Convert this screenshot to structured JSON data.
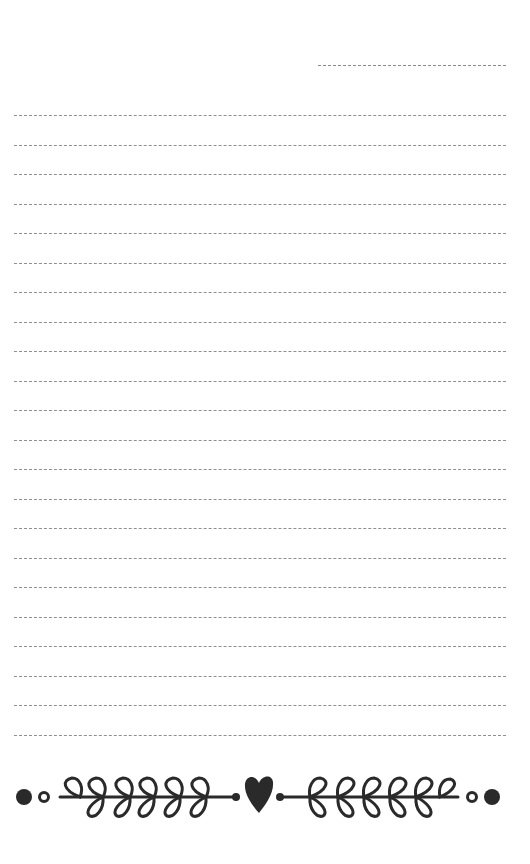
{
  "page": {
    "type": "lined notepad page",
    "background": "#ffffff",
    "line_color": "#8f8f8f",
    "ink_color": "#2a2a2a"
  },
  "date_line": {
    "label": ""
  },
  "lines": {
    "count": 22,
    "top": 0,
    "spacing": 29.5,
    "values": [
      "",
      "",
      "",
      "",
      "",
      "",
      "",
      "",
      "",
      "",
      "",
      "",
      "",
      "",
      "",
      "",
      "",
      "",
      "",
      "",
      "",
      ""
    ]
  },
  "ornament": {
    "name": "heart-and-laurel-flourish",
    "left_branch_leaves": 6,
    "right_branch_leaves": 6
  }
}
